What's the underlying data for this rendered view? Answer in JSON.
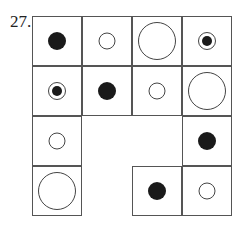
{
  "problem": {
    "number": "27."
  },
  "grid": {
    "cell_size": 50,
    "origin": [
      32,
      16
    ],
    "cells": [
      {
        "row": 0,
        "col": 0,
        "shape": "filled-dot"
      },
      {
        "row": 0,
        "col": 1,
        "shape": "small-circle"
      },
      {
        "row": 0,
        "col": 2,
        "shape": "large-circle"
      },
      {
        "row": 0,
        "col": 3,
        "shape": "target"
      },
      {
        "row": 1,
        "col": 0,
        "shape": "target"
      },
      {
        "row": 1,
        "col": 1,
        "shape": "filled-dot"
      },
      {
        "row": 1,
        "col": 2,
        "shape": "small-circle"
      },
      {
        "row": 1,
        "col": 3,
        "shape": "large-circle"
      },
      {
        "row": 2,
        "col": 0,
        "shape": "small-circle"
      },
      {
        "row": 2,
        "col": 3,
        "shape": "filled-dot"
      },
      {
        "row": 3,
        "col": 0,
        "shape": "large-circle"
      },
      {
        "row": 3,
        "col": 2,
        "shape": "filled-dot"
      },
      {
        "row": 3,
        "col": 3,
        "shape": "small-circle"
      }
    ]
  }
}
